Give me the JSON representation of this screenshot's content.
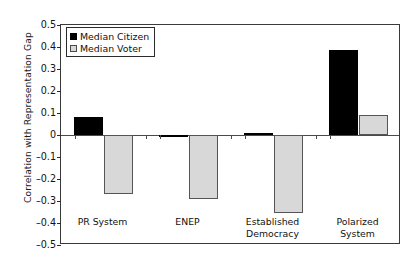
{
  "chart_data": {
    "type": "bar",
    "title": "",
    "xlabel": "",
    "ylabel": "Correlation with Representation Gap",
    "categories": [
      "PR System",
      "ENEP",
      "Established Democracy",
      "Polarized System"
    ],
    "series": [
      {
        "name": "Median Citizen",
        "color": "#000000",
        "values": [
          0.08,
          -0.01,
          0.01,
          0.385
        ]
      },
      {
        "name": "Median Voter",
        "color": "#d8d8d8",
        "values": [
          -0.27,
          -0.29,
          -0.355,
          0.09
        ]
      }
    ],
    "ylim": [
      -0.5,
      0.5
    ],
    "ytick_step": 0.1,
    "ytick_labels": [
      "0.5",
      "0.4",
      "0.3",
      "0.2",
      "0.1",
      "0",
      "-0.1",
      "-0.2",
      "-0.3",
      "-0.4",
      "-0.5"
    ],
    "ytick_values": [
      0.5,
      0.4,
      0.3,
      0.2,
      0.1,
      0,
      -0.1,
      -0.2,
      -0.3,
      -0.4,
      -0.5
    ],
    "grid": false,
    "legend_position": "top-left",
    "zero_line": true
  },
  "legend": {
    "entries": [
      {
        "label": "Median Citizen"
      },
      {
        "label": "Median Voter"
      }
    ]
  },
  "axis": {
    "y_title": "Correlation with Representation Gap"
  }
}
